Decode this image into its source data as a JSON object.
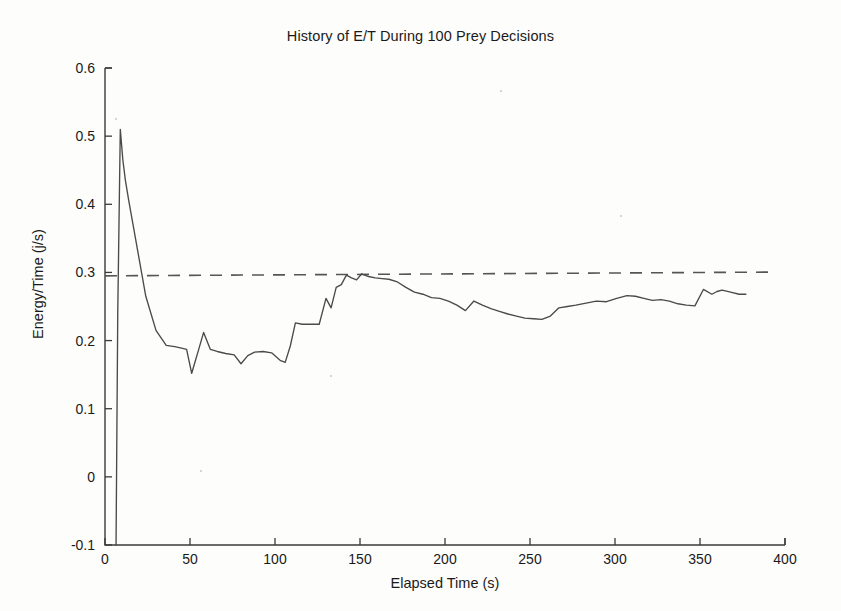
{
  "chart_data": {
    "type": "line",
    "title": "History of E/T During 100 Prey Decisions",
    "xlabel": "Elapsed Time (s)",
    "ylabel": "Energy/Time (j/s)",
    "xlim": [
      0,
      400
    ],
    "ylim": [
      -0.1,
      0.6
    ],
    "xticks": [
      0,
      50,
      100,
      150,
      200,
      250,
      300,
      350,
      400
    ],
    "xtick_labels": [
      "0",
      "50",
      "100",
      "150",
      "200",
      "250",
      "300",
      "350",
      "400"
    ],
    "yticks": [
      -0.1,
      0,
      0.1,
      0.2,
      0.3,
      0.4,
      0.5,
      0.6
    ],
    "ytick_labels": [
      "-0.1",
      "0",
      "0.1",
      "0.2",
      "0.3",
      "0.4",
      "0.5",
      "0.6"
    ],
    "grid": false,
    "legend": "none",
    "series": [
      {
        "name": "E/T history",
        "style": "solid",
        "color": "#4a4a4a",
        "x": [
          6.5,
          7.5,
          9.0,
          10.5,
          12.0,
          14.0,
          24.0,
          30.0,
          36.0,
          41.0,
          45.0,
          48.0,
          51.0,
          55.0,
          58.0,
          62.0,
          66.0,
          71.0,
          76.0,
          80.0,
          84.0,
          88.0,
          93.0,
          98.0,
          103.0,
          106.0,
          109.0,
          112.0,
          116.0,
          121.0,
          126.0,
          130.0,
          133.0,
          136.0,
          139.0,
          142.0,
          145.0,
          148.0,
          151.0,
          155.0,
          159.0,
          163.0,
          167.0,
          172.0,
          177.0,
          182.0,
          187.0,
          192.0,
          197.0,
          202.0,
          207.0,
          212.0,
          217.0,
          222.0,
          227.0,
          232.0,
          237.0,
          242.0,
          247.0,
          252.0,
          257.0,
          262.0,
          267.0,
          272.0,
          277.0,
          283.0,
          289.0,
          295.0,
          301.0,
          307.0,
          312.0,
          317.0,
          322.0,
          327.0,
          332.0,
          337.0,
          342.0,
          347.0,
          352.0,
          357.0,
          360.0,
          363.0,
          368.0,
          373.0,
          377.0
        ],
        "y": [
          -0.1,
          0.24,
          0.51,
          0.465,
          0.435,
          0.405,
          0.265,
          0.215,
          0.193,
          0.191,
          0.189,
          0.187,
          0.152,
          0.186,
          0.212,
          0.187,
          0.184,
          0.181,
          0.179,
          0.166,
          0.178,
          0.183,
          0.184,
          0.182,
          0.171,
          0.168,
          0.192,
          0.226,
          0.224,
          0.224,
          0.224,
          0.262,
          0.248,
          0.278,
          0.282,
          0.296,
          0.292,
          0.289,
          0.298,
          0.294,
          0.292,
          0.291,
          0.29,
          0.286,
          0.278,
          0.271,
          0.268,
          0.263,
          0.262,
          0.258,
          0.252,
          0.244,
          0.258,
          0.252,
          0.247,
          0.243,
          0.239,
          0.236,
          0.233,
          0.232,
          0.231,
          0.236,
          0.248,
          0.25,
          0.252,
          0.255,
          0.258,
          0.257,
          0.262,
          0.266,
          0.265,
          0.262,
          0.259,
          0.26,
          0.258,
          0.254,
          0.252,
          0.251,
          0.275,
          0.268,
          0.272,
          0.274,
          0.271,
          0.268,
          0.268
        ]
      },
      {
        "name": "threshold",
        "style": "dashed",
        "color": "#555555",
        "x": [
          0,
          393
        ],
        "y": [
          0.295,
          0.3005
        ]
      }
    ]
  },
  "figure": {
    "background_color": "#fdfdfc",
    "axis_color": "#3a3a3a",
    "text_color": "#1a1a1a"
  }
}
